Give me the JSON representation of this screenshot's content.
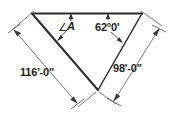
{
  "figure": {
    "background_color": "#ffffff",
    "line_color": "#3a3a3a",
    "outline_color": "#2b2b2b",
    "text_color": "#1f1f1f"
  },
  "labels": {
    "angle_a_symbol": "∠",
    "angle_a": "A",
    "angle_b": "62°0'",
    "left_side": "116'-0\"",
    "right_side": "98'-0\""
  },
  "geometry": {
    "vertex_top_left": [
      32,
      13
    ],
    "vertex_top_right": [
      142,
      13
    ],
    "vertex_bottom": [
      98,
      90
    ],
    "left_dim_start": [
      12,
      30
    ],
    "left_dim_end": [
      78,
      107
    ],
    "right_dim_start": [
      160,
      28
    ],
    "right_dim_end": [
      113,
      100
    ]
  }
}
